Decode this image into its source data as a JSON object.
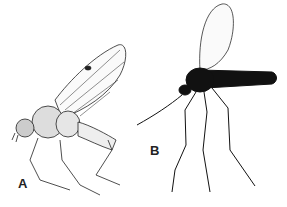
{
  "figure": {
    "panels": [
      {
        "label": "A",
        "subject": "fly with clear veined wings and stippled body"
      },
      {
        "label": "B",
        "subject": "dark-bodied fly with long legs and slender abdomen"
      }
    ]
  }
}
